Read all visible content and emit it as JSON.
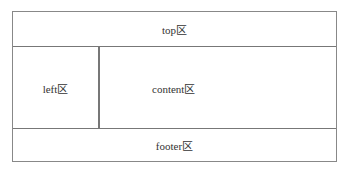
{
  "regions": {
    "top": "top区",
    "left": "left区",
    "content": "content区",
    "footer": "footer区"
  }
}
